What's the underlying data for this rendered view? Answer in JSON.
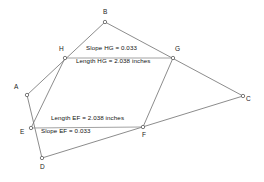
{
  "figure": {
    "canvas": {
      "width": 264,
      "height": 182
    },
    "stroke_color": "#6e6e6e",
    "label_color": "#1a1a1a",
    "background": "#ffffff"
  },
  "vertices": [
    {
      "id": "A",
      "label": "A",
      "x": 27,
      "y": 95,
      "label_x": 14,
      "label_y": 84
    },
    {
      "id": "B",
      "label": "B",
      "x": 105,
      "y": 22,
      "label_x": 103,
      "label_y": 9
    },
    {
      "id": "C",
      "label": "C",
      "x": 243,
      "y": 96,
      "label_x": 246,
      "label_y": 96
    },
    {
      "id": "D",
      "label": "D",
      "x": 42,
      "y": 158,
      "label_x": 40,
      "label_y": 164
    },
    {
      "id": "E",
      "label": "E",
      "x": 31,
      "y": 128,
      "label_x": 20,
      "label_y": 129
    },
    {
      "id": "F",
      "label": "F",
      "x": 143,
      "y": 127,
      "label_x": 142,
      "label_y": 132
    },
    {
      "id": "G",
      "label": "G",
      "x": 173,
      "y": 58,
      "label_x": 175,
      "label_y": 46
    },
    {
      "id": "H",
      "label": "H",
      "x": 65,
      "y": 58,
      "label_x": 59,
      "label_y": 46
    }
  ],
  "edges": [
    {
      "name": "edge-A-B",
      "from": "A",
      "to": "B"
    },
    {
      "name": "edge-B-C",
      "from": "B",
      "to": "C"
    },
    {
      "name": "edge-C-D",
      "from": "C",
      "to": "D"
    },
    {
      "name": "edge-D-A",
      "from": "D",
      "to": "A"
    },
    {
      "name": "edge-H-E",
      "from": "H",
      "to": "E"
    },
    {
      "name": "edge-G-F",
      "from": "G",
      "to": "F"
    },
    {
      "name": "edge-H-G",
      "from": "H",
      "to": "G"
    },
    {
      "name": "edge-E-F",
      "from": "E",
      "to": "F"
    }
  ],
  "measurements": [
    {
      "id": "slope-hg",
      "text": "Slope HG = 0.033",
      "segment": "HG",
      "quantity": "slope",
      "value": 0.033,
      "label_x": 86,
      "label_y": 45
    },
    {
      "id": "length-hg",
      "text": "Length HG = 2.038 inches",
      "segment": "HG",
      "quantity": "length",
      "value": 2.038,
      "units": "inches",
      "label_x": 76,
      "label_y": 58
    },
    {
      "id": "length-ef",
      "text": "Length EF = 2.038 inches",
      "segment": "EF",
      "quantity": "length",
      "value": 2.038,
      "units": "inches",
      "label_x": 51,
      "label_y": 115
    },
    {
      "id": "slope-ef",
      "text": "Slope EF = 0.033",
      "segment": "EF",
      "quantity": "slope",
      "value": 0.033,
      "label_x": 41,
      "label_y": 128
    }
  ]
}
